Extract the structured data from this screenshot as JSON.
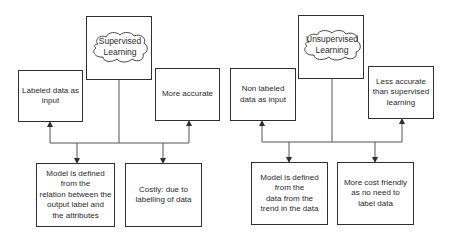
{
  "colors": {
    "stroke": "#2e2e2e",
    "text": "#2a2a2a",
    "background": "#ffffff"
  },
  "supervised": {
    "title": "Supervised\nLearning",
    "top_left": "Labeled data as\ninput",
    "top_right": "More accurate",
    "bottom_left": "Model is defined\nfrom the\nrelation between the\noutput label and\nthe attributes",
    "bottom_right": "Costly: due to\nlabelling of data"
  },
  "unsupervised": {
    "title": "Unsupervised\nLearning",
    "top_left": "Non labeled\ndata as input",
    "top_right": "Less accurate\nthan supervised\nlearning",
    "bottom_left": "Model is defined\nfrom the\ndata from the\ntrend in the data",
    "bottom_right": "More cost friendly\nas no need to\nlabel data"
  }
}
